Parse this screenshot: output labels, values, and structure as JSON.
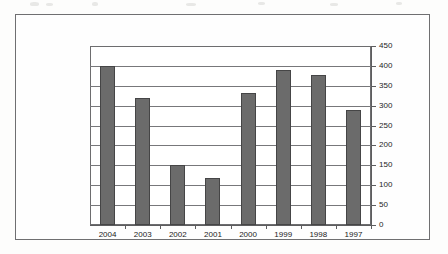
{
  "figure": {
    "frame_color": "#6f6f71",
    "background_color": "#fefefe"
  },
  "chart_data": {
    "type": "bar",
    "title": "",
    "xlabel": "",
    "ylabel": "",
    "categories": [
      "2004",
      "2003",
      "2002",
      "2001",
      "2000",
      "1999",
      "1998",
      "1997"
    ],
    "values": [
      400,
      320,
      150,
      118,
      333,
      390,
      377,
      290
    ],
    "ylim": [
      0,
      450
    ],
    "ytick_labels": [
      "450",
      "400",
      "350",
      "300",
      "250",
      "200",
      "150",
      "100",
      "50",
      "0"
    ],
    "ytick_values": [
      450,
      400,
      350,
      300,
      250,
      200,
      150,
      100,
      50,
      0
    ],
    "ytick_step": 50,
    "grid": true,
    "grid_axis": "y",
    "legend": false,
    "legend_position": "none",
    "axis_position": "right",
    "bar_color": "#6b6b6b",
    "bar_edge_color": "#454546",
    "grid_color": "#77777a",
    "axis_color": "#5d5d5f"
  }
}
